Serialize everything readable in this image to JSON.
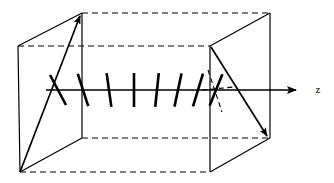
{
  "figure": {
    "background_color": "#ffffff",
    "line_color": "#000000",
    "canvas": {
      "width": 334,
      "height": 183
    },
    "axis": {
      "name": "z-axis",
      "label": "z",
      "label_position": {
        "x": 320,
        "y": 92
      },
      "start": {
        "x": 46,
        "y": 90
      },
      "end": {
        "x": 302,
        "y": 90
      },
      "arrowhead": "filled-triangle"
    },
    "left_plane": {
      "name": "entrance-polarizer-plane",
      "corners": [
        {
          "x": 18,
          "y": 46
        },
        {
          "x": 82,
          "y": 13
        },
        {
          "x": 82,
          "y": 138
        },
        {
          "x": 20,
          "y": 172
        }
      ],
      "solid_edges": [
        "left-vertical",
        "top-slant",
        "right-vertical",
        "bottom-slant"
      ]
    },
    "right_plane": {
      "name": "exit-polarizer-plane",
      "corners": [
        {
          "x": 210,
          "y": 46
        },
        {
          "x": 270,
          "y": 13
        },
        {
          "x": 270,
          "y": 138
        },
        {
          "x": 210,
          "y": 172
        }
      ],
      "solid_edges": [
        "left-vertical",
        "top-slant",
        "right-vertical",
        "bottom-slant"
      ]
    },
    "hidden_edges": [
      {
        "name": "top-back-dashed",
        "from": {
          "x": 82,
          "y": 13
        },
        "to": {
          "x": 270,
          "y": 13
        }
      },
      {
        "name": "upper-mid-dashed",
        "from": {
          "x": 18,
          "y": 46
        },
        "to": {
          "x": 210,
          "y": 46
        }
      },
      {
        "name": "lower-mid-dashed",
        "from": {
          "x": 82,
          "y": 138
        },
        "to": {
          "x": 270,
          "y": 138
        }
      },
      {
        "name": "bottom-front-dashed",
        "from": {
          "x": 20,
          "y": 172
        },
        "to": {
          "x": 210,
          "y": 172
        }
      }
    ],
    "input_vector": {
      "name": "input-polarization-arrow",
      "from": {
        "x": 20,
        "y": 172
      },
      "to": {
        "x": 80,
        "y": 14
      },
      "arrowhead": "filled-triangle",
      "description": "Arrow on the entrance plane pointing up and to the right"
    },
    "output_vector": {
      "name": "output-polarization-arrow",
      "from": {
        "x": 211,
        "y": 47
      },
      "to": {
        "x": 268,
        "y": 139
      },
      "arrowhead": "filled-triangle",
      "description": "Arrow on the exit plane pointing down and to the right"
    },
    "output_vector_projection": {
      "name": "output-projection-dashed",
      "from": {
        "x": 208,
        "y": 70
      },
      "to": {
        "x": 221,
        "y": 110
      },
      "style": "dashed"
    },
    "projection_guide": {
      "name": "projection-guide-dashed",
      "from": {
        "x": 203,
        "y": 90
      },
      "to": {
        "x": 232,
        "y": 88
      },
      "style": "dashed"
    },
    "directors": {
      "name": "director-bars",
      "count": 8,
      "bar_length": 34,
      "stroke_width": 2.6,
      "description": "Short bars crossing the z-axis, rotating progressively from leaning left to leaning right",
      "bars": [
        {
          "index": 1,
          "cx": 58,
          "cy": 90,
          "angle_deg": -28
        },
        {
          "index": 2,
          "cx": 83,
          "cy": 90,
          "angle_deg": -18
        },
        {
          "index": 3,
          "cx": 109,
          "cy": 90,
          "angle_deg": -8
        },
        {
          "index": 4,
          "cx": 134,
          "cy": 90,
          "angle_deg": 0
        },
        {
          "index": 5,
          "cx": 157,
          "cy": 90,
          "angle_deg": 6
        },
        {
          "index": 6,
          "cx": 178,
          "cy": 90,
          "angle_deg": 12
        },
        {
          "index": 7,
          "cx": 198,
          "cy": 90,
          "angle_deg": 17
        },
        {
          "index": 8,
          "cx": 216,
          "cy": 90,
          "angle_deg": 22
        }
      ]
    }
  }
}
